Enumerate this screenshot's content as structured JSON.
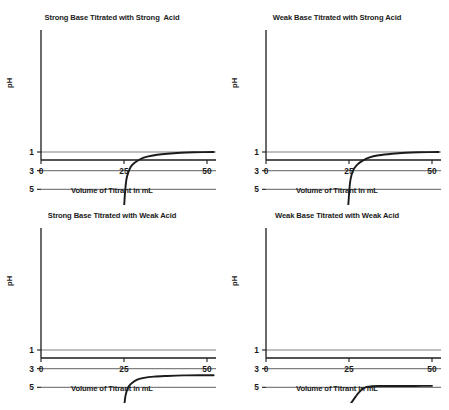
{
  "figure": {
    "title": "",
    "width": 449,
    "height": 410,
    "background": "#ffffff",
    "ink_color": "#1b1b1b",
    "grid_color": "#808080",
    "curve_color": "#1b1b1b"
  },
  "common": {
    "xlabel": "Volume of Titrant in mL",
    "ylabel": "pH",
    "xticks": [
      "0",
      "25",
      "50"
    ],
    "xtick_values": [
      0,
      25,
      50
    ],
    "yticks": [
      "1",
      "3",
      "5",
      "7",
      "9",
      "11",
      "13"
    ],
    "ytick_values": [
      1,
      3,
      5,
      7,
      9,
      11,
      13
    ],
    "xlim": [
      0,
      52
    ],
    "ylim": [
      0,
      14
    ],
    "grid": "horizontal"
  },
  "panels": [
    {
      "id": "strong-base-strong-acid",
      "title": "Strong Base Titrated with Strong  Acid"
    },
    {
      "id": "weak-base-strong-acid",
      "title": "Weak Base Titrated with Strong Acid"
    },
    {
      "id": "strong-base-weak-acid",
      "title": "Strong Base Titrated with Weak Acid"
    },
    {
      "id": "weak-base-weak-acid",
      "title": "Weak Base Titrated with Weak Acid"
    }
  ],
  "chart_data": [
    {
      "type": "line",
      "title": "Strong Base Titrated with Strong  Acid",
      "xlabel": "Volume of Titrant in mL",
      "ylabel": "pH",
      "xlim": [
        0,
        52
      ],
      "ylim": [
        0,
        14
      ],
      "xticks": [
        0,
        25,
        50
      ],
      "yticks": [
        1,
        3,
        5,
        7,
        9,
        11,
        13
      ],
      "grid": "horizontal",
      "series": [
        {
          "name": "Strong base titrated with strong acid",
          "x": [
            0,
            2,
            4,
            6,
            8,
            10,
            12,
            14,
            16,
            18,
            20,
            21,
            22,
            23,
            23.8,
            24.3,
            24.7,
            25,
            25.3,
            25.7,
            26.2,
            27,
            28,
            30,
            32,
            35,
            38,
            42,
            46,
            52
          ],
          "y": [
            13.0,
            12.95,
            12.9,
            12.85,
            12.8,
            12.72,
            12.62,
            12.5,
            12.35,
            12.15,
            11.9,
            11.72,
            11.5,
            11.15,
            10.7,
            10.0,
            8.6,
            7.0,
            5.4,
            4.0,
            3.3,
            2.6,
            2.2,
            1.75,
            1.5,
            1.3,
            1.18,
            1.08,
            1.03,
            1.0
          ]
        }
      ]
    },
    {
      "type": "line",
      "title": "Weak Base Titrated with Strong Acid",
      "xlabel": "Volume of Titrant in mL",
      "ylabel": "pH",
      "xlim": [
        0,
        52
      ],
      "ylim": [
        0,
        14
      ],
      "xticks": [
        0,
        25,
        50
      ],
      "yticks": [
        1,
        3,
        5,
        7,
        9,
        11,
        13
      ],
      "grid": "horizontal",
      "series": [
        {
          "name": "Weak base titrated with strong acid",
          "x": [
            0,
            1,
            2,
            4,
            6,
            8,
            10,
            12,
            14,
            16,
            18,
            20,
            21.5,
            22.5,
            23.5,
            24.2,
            24.7,
            25,
            25.3,
            25.8,
            26.5,
            27.5,
            29,
            31,
            34,
            38,
            42,
            46,
            52
          ],
          "y": [
            11.1,
            11.05,
            10.95,
            10.8,
            10.65,
            10.5,
            10.35,
            10.2,
            10.05,
            9.85,
            9.6,
            9.3,
            9.1,
            8.9,
            8.6,
            8.1,
            7.0,
            5.6,
            4.3,
            3.4,
            2.8,
            2.35,
            1.95,
            1.6,
            1.35,
            1.18,
            1.08,
            1.03,
            1.0
          ]
        }
      ]
    },
    {
      "type": "line",
      "title": "Strong Base Titrated with Weak Acid",
      "xlabel": "Volume of Titrant in mL",
      "ylabel": "pH",
      "xlim": [
        0,
        52
      ],
      "ylim": [
        0,
        14
      ],
      "xticks": [
        0,
        25,
        50
      ],
      "yticks": [
        1,
        3,
        5,
        7,
        9,
        11,
        13
      ],
      "grid": "horizontal",
      "series": [
        {
          "name": "Strong base titrated with weak acid",
          "x": [
            0,
            2,
            4,
            6,
            8,
            10,
            12,
            14,
            16,
            18,
            20,
            21,
            22,
            23,
            23.8,
            24.3,
            24.8,
            25.1,
            25.4,
            25.9,
            26.5,
            27.5,
            29,
            31,
            34,
            38,
            43,
            48,
            52
          ],
          "y": [
            13.0,
            12.97,
            12.93,
            12.88,
            12.82,
            12.74,
            12.64,
            12.52,
            12.36,
            12.16,
            11.9,
            11.72,
            11.5,
            11.2,
            10.8,
            10.1,
            8.6,
            7.0,
            6.0,
            5.3,
            4.85,
            4.5,
            4.18,
            3.98,
            3.85,
            3.78,
            3.72,
            3.7,
            3.7
          ]
        }
      ]
    },
    {
      "type": "line",
      "title": "Weak Base Titrated with Weak Acid",
      "xlabel": "Volume of Titrant in mL",
      "ylabel": "pH",
      "xlim": [
        0,
        52
      ],
      "ylim": [
        0,
        14
      ],
      "xticks": [
        0,
        25,
        50
      ],
      "yticks": [
        1,
        3,
        5,
        7,
        9,
        11,
        13
      ],
      "grid": "horizontal",
      "series": [
        {
          "name": "Weak base titrated with weak acid",
          "x": [
            0,
            1,
            2,
            3,
            4,
            6,
            8,
            10,
            12,
            14,
            16,
            18,
            20,
            21,
            22,
            23,
            24,
            25,
            26,
            27,
            28,
            29,
            30,
            31,
            32,
            34,
            37,
            41,
            45,
            50
          ],
          "y": [
            11.1,
            10.7,
            10.4,
            10.15,
            10.0,
            9.75,
            9.58,
            9.45,
            9.34,
            9.24,
            9.12,
            8.95,
            8.7,
            8.5,
            8.25,
            7.9,
            7.5,
            7.0,
            6.5,
            6.0,
            5.55,
            5.2,
            5.0,
            4.92,
            4.88,
            4.86,
            4.85,
            4.85,
            4.85,
            4.84
          ]
        }
      ]
    }
  ]
}
